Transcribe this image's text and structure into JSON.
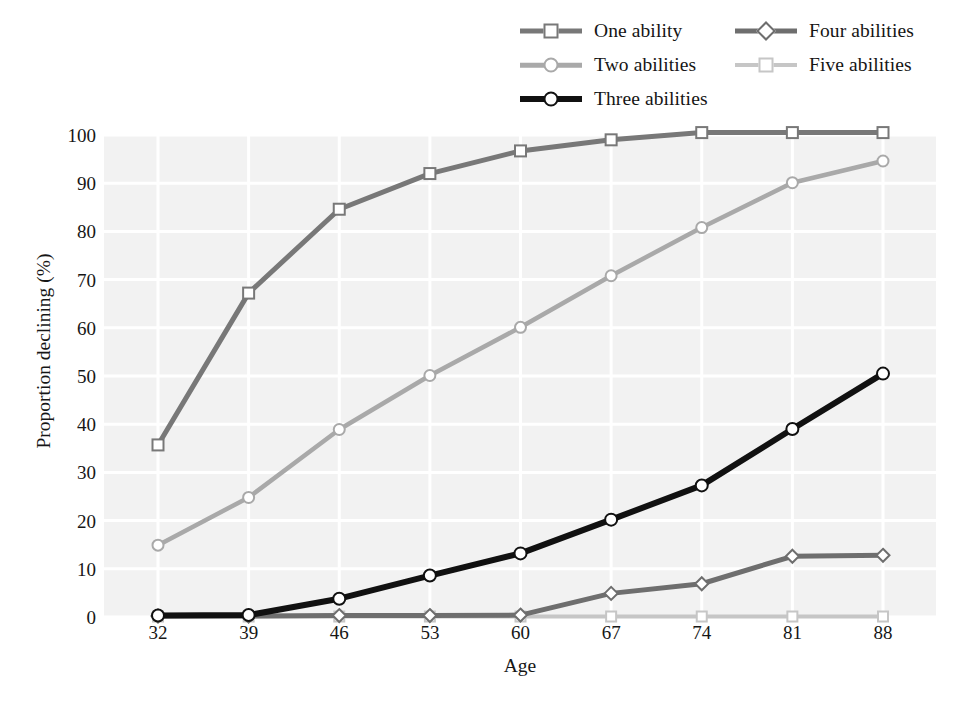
{
  "chart_data": {
    "type": "line",
    "title": "",
    "xlabel": "Age",
    "ylabel": "Proportion declining (%)",
    "x": [
      32,
      39,
      46,
      53,
      60,
      67,
      74,
      81,
      88
    ],
    "categories": [
      "32",
      "39",
      "46",
      "53",
      "60",
      "67",
      "74",
      "81",
      "88"
    ],
    "xtick_labels": [
      "32",
      "39",
      "46",
      "53",
      "60",
      "67",
      "74",
      "81",
      "88"
    ],
    "ytick_labels": [
      "100",
      "90",
      "80",
      "70",
      "60",
      "50",
      "40",
      "30",
      "20",
      "10",
      "0"
    ],
    "ytick_values": [
      100,
      90,
      80,
      70,
      60,
      50,
      40,
      30,
      20,
      10,
      0
    ],
    "ylim": [
      0,
      100
    ],
    "grid": true,
    "legend_position": "top-right",
    "series": [
      {
        "name": "One ability",
        "marker": "square",
        "color": "#787878",
        "values": [
          35.7,
          67.2,
          84.6,
          92.0,
          96.7,
          99.0,
          100.5,
          100.5,
          100.5
        ]
      },
      {
        "name": "Two abilities",
        "marker": "circle",
        "color": "#a9a9a9",
        "values": [
          14.9,
          24.8,
          38.9,
          50.1,
          60.1,
          70.8,
          80.8,
          90.1,
          94.6
        ]
      },
      {
        "name": "Three abilities",
        "marker": "circle",
        "color": "#111111",
        "values": [
          0.3,
          0.4,
          3.8,
          8.6,
          13.2,
          20.2,
          27.3,
          39.0,
          50.5
        ]
      },
      {
        "name": "Four abilities",
        "marker": "diamond",
        "color": "#6e6e6e",
        "values": [
          0.2,
          0.2,
          0.3,
          0.3,
          0.4,
          4.9,
          6.9,
          12.6,
          12.8
        ]
      },
      {
        "name": "Five abilities",
        "marker": "square",
        "color": "#c6c6c6",
        "values": [
          0.1,
          0.1,
          0.1,
          0.1,
          0.1,
          0.1,
          0.1,
          0.1,
          0.1
        ]
      }
    ]
  },
  "legend": {
    "items": [
      {
        "label": "One ability",
        "marker": "square",
        "color": "#787878",
        "lw": 5,
        "row": 0,
        "col": 0
      },
      {
        "label": "Two abilities",
        "marker": "circle",
        "color": "#a9a9a9",
        "lw": 4.5,
        "row": 1,
        "col": 0
      },
      {
        "label": "Three abilities",
        "marker": "circle",
        "color": "#111111",
        "lw": 6,
        "row": 2,
        "col": 0
      },
      {
        "label": "Four abilities",
        "marker": "diamond",
        "color": "#6e6e6e",
        "lw": 5,
        "row": 0,
        "col": 1
      },
      {
        "label": "Five abilities",
        "marker": "square",
        "color": "#c6c6c6",
        "lw": 4,
        "row": 1,
        "col": 1
      }
    ]
  },
  "colors": {
    "plot_background": "#f2f2f2",
    "gridline": "#ffffff",
    "page_background": "#ffffff",
    "text": "#161616"
  }
}
